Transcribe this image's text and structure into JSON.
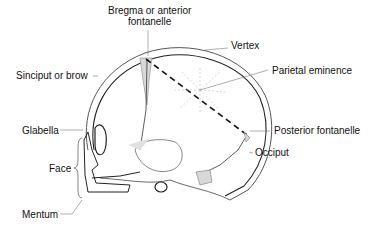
{
  "diagram": {
    "labels": {
      "bregma_line1": "Bregma or anterior",
      "bregma_line2": "fontanelle",
      "vertex": "Vertex",
      "sinciput": "Sinciput or brow",
      "parietal_eminence": "Parietal eminence",
      "glabella": "Glabella",
      "posterior_fontanelle": "Posterior fontanelle",
      "occiput": "Occiput",
      "face": "Face",
      "mentum": "Mentum"
    },
    "colors": {
      "line": "#222222",
      "outline": "#555555",
      "fontanelle_fill": "#d8d8d8",
      "background": "#ffffff"
    }
  }
}
